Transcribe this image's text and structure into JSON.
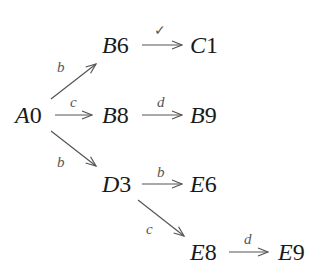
{
  "diagram": {
    "type": "state-transition-graph",
    "nodes": [
      {
        "id": "A0",
        "letter": "A",
        "num": "0"
      },
      {
        "id": "B6",
        "letter": "B",
        "num": "6"
      },
      {
        "id": "C1",
        "letter": "C",
        "num": "1"
      },
      {
        "id": "B8",
        "letter": "B",
        "num": "8"
      },
      {
        "id": "B9",
        "letter": "B",
        "num": "9"
      },
      {
        "id": "D3",
        "letter": "D",
        "num": "3"
      },
      {
        "id": "E6",
        "letter": "E",
        "num": "6"
      },
      {
        "id": "E8",
        "letter": "E",
        "num": "8"
      },
      {
        "id": "E9",
        "letter": "E",
        "num": "9"
      }
    ],
    "edges": [
      {
        "from": "A0",
        "to": "B6",
        "label": "b"
      },
      {
        "from": "B6",
        "to": "C1",
        "label": "✓"
      },
      {
        "from": "A0",
        "to": "B8",
        "label": "c"
      },
      {
        "from": "B8",
        "to": "B9",
        "label": "d"
      },
      {
        "from": "A0",
        "to": "D3",
        "label": "b"
      },
      {
        "from": "D3",
        "to": "E6",
        "label": "b"
      },
      {
        "from": "D3",
        "to": "E8",
        "label": "c"
      },
      {
        "from": "E8",
        "to": "E9",
        "label": "d"
      }
    ],
    "colors": {
      "text": "#1a1a1a",
      "arrow": "#555555",
      "label": "#555555",
      "background": "#ffffff"
    }
  }
}
